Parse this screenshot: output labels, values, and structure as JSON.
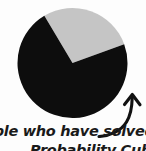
{
  "figure": {
    "background_color": "#fdfdfd"
  },
  "caption": {
    "line1": "ople who have solved",
    "line2": "Probability Cube"
  },
  "annotation": {
    "arrow_name": "curved-arrow-pointing-to-pie"
  },
  "chart_data": {
    "type": "pie",
    "title": "",
    "subtitle": "",
    "xlabel": "",
    "ylabel": "",
    "legend_position": "none",
    "grid": false,
    "labels": [
      "Black slice",
      "Gray slice"
    ],
    "values": [
      72,
      28
    ],
    "colors": [
      "#0d0d0d",
      "#c5c5c5"
    ],
    "start_angle_deg": -20,
    "slices": [
      {
        "label": "Black slice",
        "value": 72,
        "percent": 72,
        "color": "#0d0d0d",
        "start_angle_deg": 0,
        "end_angle_deg": 259
      },
      {
        "label": "Gray slice",
        "value": 28,
        "percent": 28,
        "color": "#c5c5c5",
        "start_angle_deg": 259,
        "end_angle_deg": 360
      }
    ],
    "center_x": 72.5,
    "center_y": 63,
    "radius": 55
  }
}
